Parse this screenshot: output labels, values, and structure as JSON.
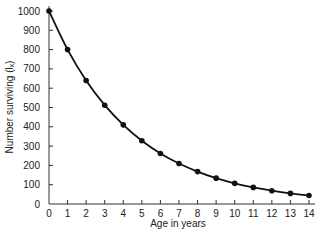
{
  "chart_data": {
    "type": "line",
    "title": "",
    "xlabel": "Age in years",
    "ylabel": "Number surviving (lₓ)",
    "x": [
      0,
      1,
      2,
      3,
      4,
      5,
      6,
      7,
      8,
      9,
      10,
      11,
      12,
      13,
      14
    ],
    "series": [
      {
        "name": "Number surviving",
        "values": [
          1000,
          800,
          640,
          512,
          410,
          328,
          262,
          210,
          168,
          134,
          107,
          86,
          69,
          55,
          44
        ]
      }
    ],
    "xticks": [
      "0",
      "1",
      "2",
      "3",
      "4",
      "5",
      "6",
      "7",
      "8",
      "9",
      "10",
      "11",
      "12",
      "13",
      "14"
    ],
    "yticks": [
      "0",
      "100",
      "200",
      "300",
      "400",
      "500",
      "600",
      "700",
      "800",
      "900",
      "1000"
    ],
    "xlim": [
      0,
      14
    ],
    "ylim": [
      0,
      1000
    ],
    "grid": false,
    "legend": "none",
    "markers": "filled-circle",
    "line_color": "#111111"
  }
}
